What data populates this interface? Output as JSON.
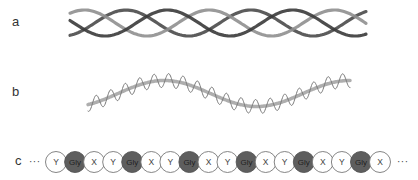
{
  "panels": {
    "a": {
      "label": "a",
      "description": "collagen triple helix",
      "strands": [
        {
          "color": "#4a4a4a",
          "phase": 0.0
        },
        {
          "color": "#8f8f8f",
          "phase": 2.094
        },
        {
          "color": "#3a3a3a",
          "phase": 4.189
        }
      ],
      "x_start": 70,
      "x_end": 366,
      "y_center": 23,
      "amplitude": 13,
      "period": 125
    },
    "b": {
      "label": "b",
      "description": "polypeptide chain coiled around superhelix axis",
      "axis_color": "#9a9a9a",
      "coil_color": "#7a7a7a",
      "x_start": 88,
      "x_end": 350,
      "y_center": 93.5,
      "axis_amplitude": 13,
      "axis_period": 185,
      "axis_offset": 118,
      "coil_amplitude": 7,
      "coil_period": 14.5
    },
    "c": {
      "label": "c",
      "leading_ellipsis": "···",
      "trailing_ellipsis": "···",
      "residues": [
        "Y",
        "Gly",
        "X",
        "Y",
        "Gly",
        "X",
        "Y",
        "Gly",
        "X",
        "Y",
        "Gly",
        "X",
        "Y",
        "Gly",
        "X",
        "Y",
        "Gly",
        "X"
      ],
      "gly_fill": "#5e5e5e",
      "other_fill": "#ffffff",
      "stroke": "#777777",
      "x_first_center": 56,
      "spacing": 19.06,
      "y_center": 162,
      "radius": 10.5
    }
  }
}
